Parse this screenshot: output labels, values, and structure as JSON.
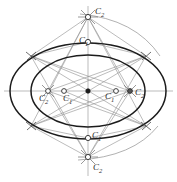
{
  "figure": {
    "kind": "geometric-construction",
    "colors": {
      "ellipse_stroke": "#1c1c1c",
      "construction_stroke": "#8a8a8a",
      "axis_stroke": "#8a8a8a",
      "arc_stroke": "#8a8a8a",
      "label_color": "#2a2a2a",
      "marker_fill": "#ffffff",
      "center_fill": "#1c1c1c",
      "background": "#ffffff"
    },
    "geometry": {
      "center": {
        "x": 88,
        "y": 91
      },
      "outer_ellipse": {
        "cx": 88,
        "cy": 91,
        "rx": 78,
        "ry": 48
      },
      "inner_ellipse": {
        "cx": 88,
        "cy": 91,
        "rx": 57,
        "ry": 36
      }
    },
    "labels": [
      {
        "id": "c2-top",
        "base": "C",
        "sub": "2",
        "text": "C2",
        "x": 95,
        "y": 7
      },
      {
        "id": "c1-top",
        "base": "C",
        "sub": "1",
        "text": "C1",
        "x": 79,
        "y": 36
      },
      {
        "id": "c2-left",
        "base": "C",
        "sub": "2",
        "text": "C2",
        "x": 39,
        "y": 94
      },
      {
        "id": "c1-left",
        "base": "C",
        "sub": "1",
        "text": "C1",
        "x": 63,
        "y": 94
      },
      {
        "id": "c1-right",
        "base": "C",
        "sub": "1",
        "text": "C1",
        "x": 105,
        "y": 92
      },
      {
        "id": "c2-right",
        "base": "C",
        "sub": "2",
        "text": "C2",
        "x": 135,
        "y": 88
      },
      {
        "id": "c1-bottom",
        "base": "C",
        "sub": "1",
        "text": "C1",
        "x": 92,
        "y": 131
      },
      {
        "id": "c2-bottom",
        "base": "C",
        "sub": "2",
        "text": "C2",
        "x": 93,
        "y": 163
      }
    ],
    "markers": [
      {
        "id": "marker-c2-top",
        "x": 88,
        "y": 17,
        "type": "ring"
      },
      {
        "id": "marker-c1-top",
        "x": 88,
        "y": 42,
        "type": "ring"
      },
      {
        "id": "marker-c2-left",
        "x": 48,
        "y": 91,
        "type": "ring"
      },
      {
        "id": "marker-c1-left",
        "x": 64,
        "y": 91,
        "type": "ring"
      },
      {
        "id": "marker-c1-right",
        "x": 116,
        "y": 91,
        "type": "ring"
      },
      {
        "id": "marker-c2-right",
        "x": 130,
        "y": 91,
        "type": "dot"
      },
      {
        "id": "marker-c1-bottom",
        "x": 88,
        "y": 138,
        "type": "ring"
      },
      {
        "id": "marker-c2-bottom",
        "x": 88,
        "y": 157,
        "type": "ring"
      },
      {
        "id": "marker-center",
        "x": 88,
        "y": 91,
        "type": "center"
      }
    ],
    "tangent_ticks": [
      {
        "id": "tick-upper-left",
        "x": 31,
        "y": 56
      },
      {
        "id": "tick-upper-right",
        "x": 146,
        "y": 56
      },
      {
        "id": "tick-lower-left",
        "x": 31,
        "y": 126
      },
      {
        "id": "tick-lower-right",
        "x": 146,
        "y": 126
      }
    ]
  }
}
